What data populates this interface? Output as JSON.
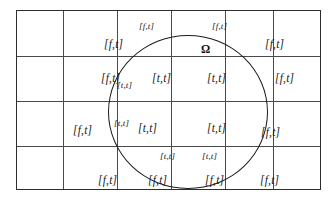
{
  "figure": {
    "background_color": "#ffffff",
    "line_color": "#4a4a4a",
    "border_color": "#2e2e2e",
    "circle_color": "#1d1d1d",
    "text_color": "#1a1a1a"
  },
  "grid": {
    "columns": 6,
    "rows": 4,
    "column_edges": [
      0,
      46,
      100,
      154,
      208,
      256,
      305
    ],
    "row_edges": [
      0,
      45,
      90,
      135,
      180
    ]
  },
  "domain": {
    "symbol": "Ω",
    "name": "omega-domain-label",
    "x": 184,
    "y": 33
  },
  "labels": [
    {
      "text": "[f,t]",
      "x": 87,
      "y": 28,
      "size": "normal"
    },
    {
      "text": "[f,t]",
      "x": 122,
      "y": 11,
      "size": "small"
    },
    {
      "text": "[f,t]",
      "x": 195,
      "y": 11,
      "size": "small"
    },
    {
      "text": "[f,t]",
      "x": 248,
      "y": 28,
      "size": "normal"
    },
    {
      "text": "[f,t]",
      "x": 84,
      "y": 62,
      "size": "normal"
    },
    {
      "text": "[t,t]",
      "x": 100,
      "y": 70,
      "size": "small"
    },
    {
      "text": "[t,t]",
      "x": 135,
      "y": 62,
      "size": "normal"
    },
    {
      "text": "[t,t]",
      "x": 190,
      "y": 62,
      "size": "normal"
    },
    {
      "text": "[f,t]",
      "x": 258,
      "y": 62,
      "size": "normal"
    },
    {
      "text": "[f,t]",
      "x": 56,
      "y": 114,
      "size": "normal"
    },
    {
      "text": "[t,t]",
      "x": 97,
      "y": 108,
      "size": "small"
    },
    {
      "text": "[t,t]",
      "x": 121,
      "y": 112,
      "size": "normal"
    },
    {
      "text": "[t,t]",
      "x": 190,
      "y": 112,
      "size": "normal"
    },
    {
      "text": "[f,t]",
      "x": 244,
      "y": 116,
      "size": "normal"
    },
    {
      "text": "[t,t]",
      "x": 143,
      "y": 141,
      "size": "small"
    },
    {
      "text": "[t,t]",
      "x": 185,
      "y": 141,
      "size": "small"
    },
    {
      "text": "[f,t]",
      "x": 81,
      "y": 164,
      "size": "normal"
    },
    {
      "text": "[f,t]",
      "x": 131,
      "y": 164,
      "size": "normal"
    },
    {
      "text": "[f,t]",
      "x": 188,
      "y": 164,
      "size": "normal"
    },
    {
      "text": "[f,t]",
      "x": 243,
      "y": 164,
      "size": "normal"
    }
  ]
}
